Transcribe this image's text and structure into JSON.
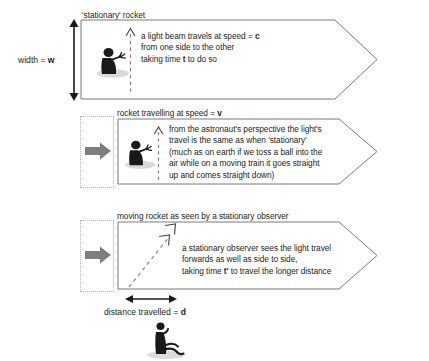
{
  "figure": {
    "title_hidden": "special relativity time dilation rocket diagram",
    "line_color": "#6b6b6b",
    "text_color": "#231f20",
    "grey_arrow_color": "#808080",
    "dotted_box_color": "#b3b3b3"
  },
  "measures": {
    "width_label": "width = ",
    "width_symbol": "w",
    "distance_label": "distance travelled = ",
    "distance_symbol": "d"
  },
  "panels": [
    {
      "id": "stationary-rocket",
      "caption": "'stationary' rocket",
      "lines": [
        {
          "pre": "a light beam travels at speed = ",
          "bold": "c",
          "post": ""
        },
        {
          "pre": "from one side to the other",
          "bold": "",
          "post": ""
        },
        {
          "pre": "taking time ",
          "bold": "t",
          "post": " to do so"
        }
      ]
    },
    {
      "id": "rocket-travelling",
      "caption": "rocket travelling at speed = ",
      "caption_bold": "v",
      "lines": [
        {
          "pre": "from the astronaut's perspective the light's",
          "bold": "",
          "post": ""
        },
        {
          "pre": "travel is the same as when 'stationary'",
          "bold": "",
          "post": ""
        },
        {
          "pre": "(much as on earth if we toss a ball into the",
          "bold": "",
          "post": ""
        },
        {
          "pre": "air while on a moving train it goes straight",
          "bold": "",
          "post": ""
        },
        {
          "pre": "up and comes straight down)",
          "bold": "",
          "post": ""
        }
      ]
    },
    {
      "id": "moving-rocket-observed",
      "caption": "moving rocket as seen by a stationary observer",
      "lines": [
        {
          "pre": "a stationary observer sees the light travel",
          "bold": "",
          "post": ""
        },
        {
          "pre": "forwards as well as side to side,",
          "bold": "",
          "post": ""
        },
        {
          "pre": "taking time ",
          "bold": "t'",
          "post": " to travel the longer distance"
        }
      ]
    }
  ],
  "icons": {
    "astronaut": "astronaut-figure-icon",
    "observer": "seated-observer-icon",
    "motion_arrow": "grey-block-arrow-icon",
    "light_path_vertical": "dashed-vertical-light-path-icon",
    "light_path_diagonal": "dashed-diagonal-light-path-icon",
    "width_arrow": "double-headed-vertical-arrow-icon",
    "distance_arrow": "double-headed-horizontal-arrow-icon"
  }
}
